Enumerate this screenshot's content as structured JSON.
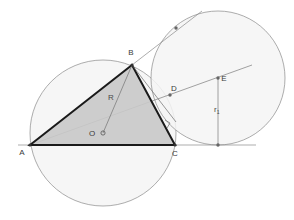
{
  "figure": {
    "background_color": "#ffffff",
    "width": 294,
    "height": 220
  },
  "colors": {
    "triangle_fill": "#c9c9c9",
    "triangle_stroke": "#1a1a1a",
    "circle_stroke": "#8a8a8a",
    "circle_fill": "#f2f2f2",
    "thin_line": "#7d7d7d",
    "label_color": "#3a3a3a",
    "point_color": "#555555"
  },
  "labels": {
    "A": "A",
    "B": "B",
    "C": "C",
    "D": "D",
    "E": "E",
    "O": "O",
    "R": "R",
    "r1_base": "r",
    "r1_sub": "1"
  },
  "points": {
    "A": {
      "name": "A",
      "x": 30,
      "y": 145
    },
    "B": {
      "name": "B",
      "x": 132,
      "y": 65
    },
    "C": {
      "name": "C",
      "x": 175,
      "y": 145
    },
    "D": {
      "name": "D",
      "x": 170,
      "y": 95
    },
    "E": {
      "name": "E",
      "x": 218,
      "y": 78
    },
    "O": {
      "name": "O",
      "x": 103,
      "y": 133
    },
    "F": {
      "name": "F",
      "x": 176,
      "y": 28
    },
    "T": {
      "name": "T",
      "x": 218,
      "y": 145
    }
  },
  "label_positions": {
    "A": {
      "x": 22,
      "y": 153
    },
    "B": {
      "x": 129,
      "y": 55
    },
    "C": {
      "x": 172,
      "y": 155
    },
    "D": {
      "x": 172,
      "y": 91
    },
    "E": {
      "x": 222,
      "y": 80
    },
    "O": {
      "x": 90,
      "y": 133
    },
    "R": {
      "x": 109,
      "y": 99
    },
    "r1": {
      "x": 214,
      "y": 111
    }
  },
  "circles": {
    "circumcircle": {
      "name": "circumcircle",
      "cx": 103,
      "cy": 133,
      "r": 73
    },
    "excircle": {
      "name": "tangent-circle",
      "cx": 218,
      "cy": 78,
      "r": 67
    }
  },
  "segments": {
    "triangle_AB": {
      "x1": 30,
      "y1": 145,
      "x2": 132,
      "y2": 65
    },
    "triangle_BC": {
      "x1": 132,
      "y1": 65,
      "x2": 175,
      "y2": 145
    },
    "triangle_CA": {
      "x1": 175,
      "y1": 145,
      "x2": 30,
      "y2": 145
    },
    "radius_OB": {
      "x1": 103,
      "y1": 133,
      "x2": 132,
      "y2": 65
    },
    "bisector_A_to_E": {
      "x1": 30,
      "y1": 145,
      "x2": 252,
      "y2": 65
    },
    "line_B_to_F": {
      "x1": 132,
      "y1": 65,
      "x2": 200,
      "y2": 12
    },
    "baseline_extend": {
      "x1": 18,
      "y1": 145,
      "x2": 256,
      "y2": 145
    },
    "radius_r1": {
      "x1": 218,
      "y1": 78,
      "x2": 218,
      "y2": 145
    },
    "chord_B_to_D": {
      "x1": 132,
      "y1": 65,
      "x2": 175,
      "y2": 145
    }
  },
  "marks": {
    "right_angle_at_C_side": {
      "x": 168,
      "y": 124,
      "size": 6
    }
  }
}
